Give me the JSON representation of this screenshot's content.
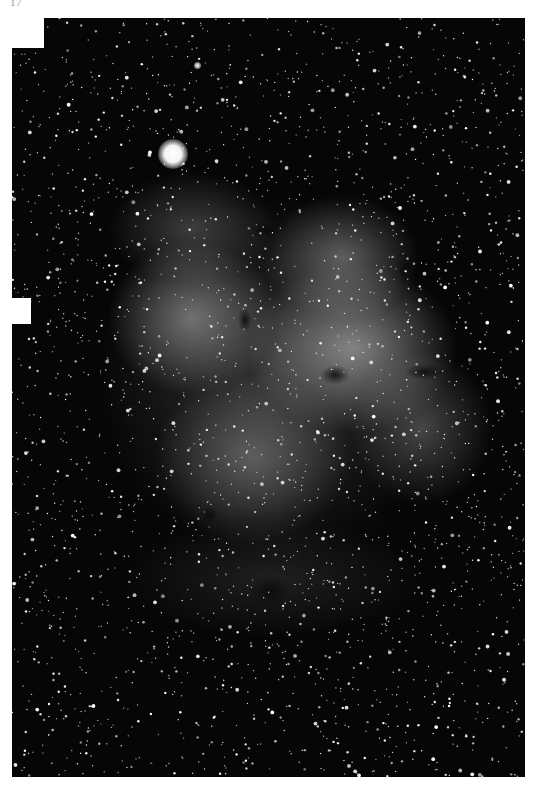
{
  "page": {
    "number": "17",
    "background": "#ffffff"
  },
  "photo": {
    "subject": "emission nebula star field",
    "tone": "black-and-white",
    "background_color": "#060606",
    "bright_star": {
      "x": 161,
      "y": 136
    },
    "dark_globules": [
      {
        "x": 335,
        "y": 375,
        "w": 30,
        "h": 20
      },
      {
        "x": 425,
        "y": 372,
        "w": 40,
        "h": 16
      },
      {
        "x": 245,
        "y": 320,
        "w": 14,
        "h": 24
      },
      {
        "x": 210,
        "y": 515,
        "w": 16,
        "h": 18
      },
      {
        "x": 270,
        "y": 590,
        "w": 40,
        "h": 30
      },
      {
        "x": 375,
        "y": 520,
        "w": 30,
        "h": 40
      },
      {
        "x": 405,
        "y": 270,
        "w": 14,
        "h": 30
      },
      {
        "x": 155,
        "y": 435,
        "w": 14,
        "h": 12
      },
      {
        "x": 265,
        "y": 230,
        "w": 30,
        "h": 16
      }
    ],
    "star_count": 2600,
    "seed": 17
  }
}
